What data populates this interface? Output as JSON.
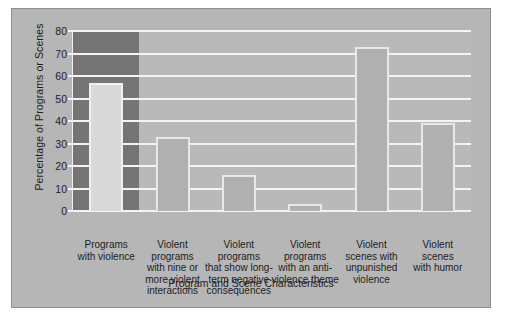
{
  "chart_data": {
    "type": "bar",
    "title": "",
    "xlabel": "Program and Scene Characteristics",
    "ylabel": "Percentage of Programs or Scenes",
    "categories": [
      "Programs with violence",
      "Violent programs with nine or more violent interactions",
      "Violent programs that show long-term negative consequences",
      "Violent programs with an anti-violence theme",
      "Violent scenes with unpunished violence",
      "Violent scenes with humor"
    ],
    "category_lines": [
      [
        "Programs",
        "with violence"
      ],
      [
        "Violent",
        "programs",
        "with nine or",
        "more violent",
        "interactions"
      ],
      [
        "Violent",
        "programs",
        "that show long-",
        "term negative",
        "consequences"
      ],
      [
        "Violent",
        "programs",
        "with an anti-",
        "violence theme"
      ],
      [
        "Violent",
        "scenes with",
        "unpunished",
        "violence"
      ],
      [
        "Violent",
        "scenes",
        "with humor"
      ]
    ],
    "values": [
      57,
      33,
      16,
      3,
      73,
      39
    ],
    "ylim": [
      0,
      80
    ],
    "yticks": [
      0,
      10,
      20,
      30,
      40,
      50,
      60,
      70,
      80
    ],
    "ytick_labels": [
      "0",
      "10",
      "20",
      "30",
      "40",
      "50",
      "60",
      "70",
      "80"
    ],
    "grid": true,
    "legend": false,
    "highlighted_category_index": 0,
    "colors": {
      "figure_background": "#b6b6b6",
      "plot_background": "#b9b9b9",
      "highlight_band": "#757575",
      "bar_fill": "#b0b0b0",
      "bar_fill_highlighted": "#d9d9d9",
      "bar_border": "#e8e8e8",
      "gridline": "#f4f4f4",
      "text": "#1d1d1d",
      "page_background": "#ffffff"
    }
  }
}
